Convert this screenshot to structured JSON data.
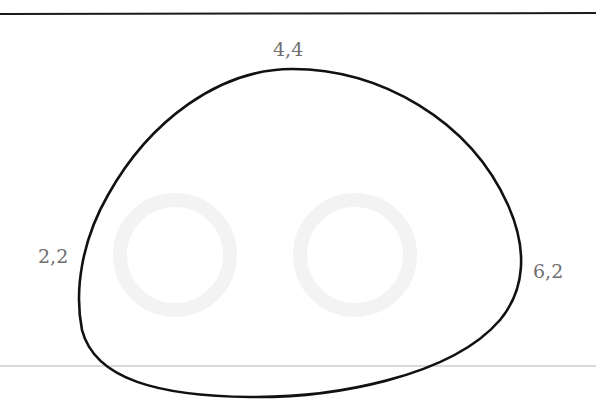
{
  "figure": {
    "labels": [
      {
        "id": "top",
        "text": "4,4"
      },
      {
        "id": "left",
        "text": "2,2"
      },
      {
        "id": "right",
        "text": "6,2"
      }
    ],
    "colors": {
      "curve": "#111111",
      "label": "#6f6f6f",
      "top_rule": "#1a1a1a",
      "bottom_rule": "#b5b5b5",
      "background": "#ffffff"
    }
  }
}
